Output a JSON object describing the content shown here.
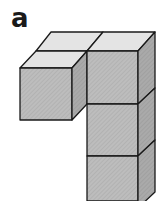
{
  "figure": {
    "label": "a",
    "cube_count": 4,
    "colors": {
      "top_face": "#e6e6e6",
      "front_face": "#b8b8b8",
      "side_face": "#a6a6a6",
      "edge": "#1a1a1a"
    }
  }
}
